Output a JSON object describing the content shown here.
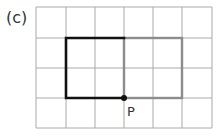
{
  "figure": {
    "label": "(c)",
    "point_label": "P",
    "grid": {
      "columns": 6,
      "rows": 4,
      "x_lines": [
        36,
        66,
        95,
        124,
        153,
        182,
        212
      ],
      "y_lines": [
        7,
        38,
        68,
        98,
        128
      ],
      "line_color": "#aaaaaa"
    },
    "shapes": [
      {
        "name": "original-rectangle",
        "color": "#111111",
        "width": 2.6,
        "x": 66,
        "y": 38,
        "w": 58,
        "h": 60,
        "cols": 2,
        "rows": 2
      },
      {
        "name": "image-rectangle",
        "color": "#8c8c8c",
        "width": 2.4,
        "x": 124,
        "y": 38,
        "w": 58,
        "h": 60,
        "cols": 2,
        "rows": 2
      }
    ],
    "point": {
      "x": 124,
      "y": 98,
      "r": 3,
      "color": "#111111"
    }
  }
}
